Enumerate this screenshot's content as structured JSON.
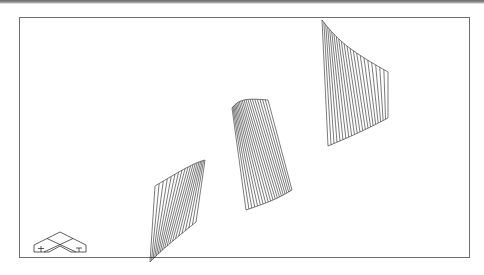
{
  "figure": {
    "line_color": "#222222",
    "frame_color": "#6e6e6e",
    "background": "#ffffff"
  },
  "surfaces": [
    {
      "name": "small-twisted-sheet",
      "position": "lower-left",
      "lines": 18
    },
    {
      "name": "medium-twisted-sheet",
      "position": "center",
      "lines": 20
    },
    {
      "name": "large-twisted-sheet",
      "position": "upper-right",
      "lines": 22
    }
  ],
  "tripod": {
    "name": "isometric-axis-icon",
    "position": "bottom-left"
  }
}
